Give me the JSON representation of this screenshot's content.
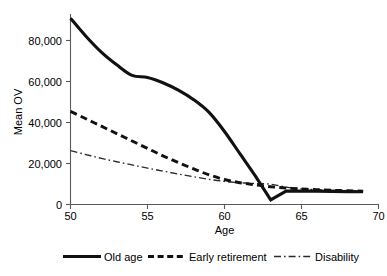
{
  "chart_data": {
    "type": "line",
    "title": "",
    "xlabel": "Age",
    "ylabel": "Mean OV",
    "xlim": [
      50,
      70
    ],
    "ylim": [
      0,
      90000
    ],
    "grid": false,
    "legend_position": "bottom",
    "xticks": [
      50,
      55,
      60,
      65,
      70
    ],
    "xtick_labels": [
      "50",
      "55",
      "60",
      "65",
      "70"
    ],
    "yticks": [
      0,
      20000,
      40000,
      60000,
      80000
    ],
    "ytick_labels": [
      "0",
      "20,000",
      "40,000",
      "60,000",
      "80,000"
    ],
    "x": [
      50,
      51,
      52,
      53,
      54,
      55,
      56,
      57,
      58,
      59,
      60,
      61,
      62,
      63,
      64,
      65,
      66,
      67,
      68,
      69
    ],
    "series": [
      {
        "name": "Old age",
        "style": "solid",
        "values": [
          88000,
          79500,
          72000,
          66000,
          61000,
          60000,
          57500,
          54000,
          49500,
          43500,
          34500,
          24000,
          13500,
          2200,
          6300,
          6400,
          6300,
          6200,
          6100,
          6000
        ]
      },
      {
        "name": "Early retirement",
        "style": "dashed",
        "values": [
          44000,
          40500,
          37000,
          33500,
          30000,
          26500,
          23000,
          19800,
          16800,
          14000,
          11800,
          10300,
          9300,
          8400,
          7800,
          7300,
          7000,
          6700,
          6500,
          6300
        ]
      },
      {
        "name": "Disability",
        "style": "dash-dot",
        "values": [
          25500,
          23600,
          21800,
          20200,
          18700,
          17200,
          15800,
          14400,
          13100,
          11900,
          10900,
          10300,
          9900,
          9600,
          8200,
          7400,
          7000,
          6700,
          6500,
          6300
        ]
      }
    ],
    "legend": [
      {
        "label": "Old age",
        "style": "solid"
      },
      {
        "label": "Early retirement",
        "style": "dashed"
      },
      {
        "label": "Disability",
        "style": "dash-dot"
      }
    ]
  }
}
